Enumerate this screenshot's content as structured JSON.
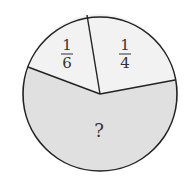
{
  "diagram": {
    "type": "pie-fraction-problem",
    "colors": {
      "stroke": "#222222",
      "light_slice": "#f2f2f2",
      "unknown_slice": "#e0e0e0",
      "background": "#ffffff",
      "text": "#333333"
    },
    "slices": [
      {
        "label": "1/6",
        "numerator": "1",
        "denominator": "6",
        "fraction": 0.1667
      },
      {
        "label": "1/4",
        "numerator": "1",
        "denominator": "4",
        "fraction": 0.25
      },
      {
        "label": "?",
        "text": "?",
        "fraction": "unknown"
      }
    ]
  }
}
